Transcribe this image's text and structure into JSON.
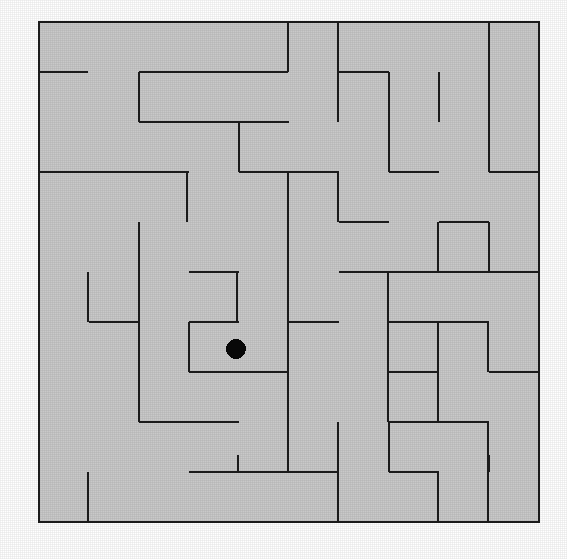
{
  "figure": {
    "kind": "maze-puzzle",
    "background_color": "#ffffff",
    "interior_color": "#c9c9c9",
    "wall_color": "#1c1c1c",
    "marker_color": "#080808",
    "canvas": {
      "width": 567,
      "height": 559
    }
  },
  "maze": {
    "origin_x": 39,
    "origin_y": 22,
    "cell_size": 50,
    "cols": 10,
    "rows": 10,
    "wall_thickness": 2.4,
    "border": {
      "x": 39,
      "y": 22,
      "width": 500,
      "height": 500
    },
    "marker": {
      "cx": 236,
      "cy": 349,
      "r": 10,
      "shape": "filled-circle",
      "label": "position-dot"
    },
    "horizontal_walls": [
      [
        39,
        72,
        88
      ],
      [
        139,
        72,
        288
      ],
      [
        339,
        72,
        389
      ],
      [
        139,
        122,
        289
      ],
      [
        39,
        172,
        189
      ],
      [
        239,
        172,
        289
      ],
      [
        289,
        172,
        339
      ],
      [
        389,
        172,
        439
      ],
      [
        489,
        172,
        539
      ],
      [
        339,
        222,
        389
      ],
      [
        439,
        222,
        489
      ],
      [
        189,
        272,
        239
      ],
      [
        339,
        272,
        389
      ],
      [
        389,
        272,
        489
      ],
      [
        489,
        272,
        539
      ],
      [
        89,
        322,
        139
      ],
      [
        189,
        322,
        239
      ],
      [
        289,
        322,
        339
      ],
      [
        389,
        322,
        439
      ],
      [
        439,
        322,
        489
      ],
      [
        189,
        372,
        289
      ],
      [
        389,
        372,
        439
      ],
      [
        489,
        372,
        539
      ],
      [
        139,
        422,
        189
      ],
      [
        189,
        422,
        239
      ],
      [
        389,
        422,
        439
      ],
      [
        439,
        422,
        489
      ],
      [
        189,
        472,
        289
      ],
      [
        289,
        472,
        339
      ],
      [
        389,
        472,
        439
      ]
    ],
    "vertical_walls": [
      [
        139,
        72,
        122
      ],
      [
        239,
        122,
        172
      ],
      [
        288,
        22,
        72
      ],
      [
        338,
        22,
        122
      ],
      [
        389,
        72,
        172
      ],
      [
        439,
        72,
        122
      ],
      [
        489,
        22,
        172
      ],
      [
        288,
        172,
        272
      ],
      [
        338,
        172,
        222
      ],
      [
        438,
        222,
        272
      ],
      [
        139,
        222,
        272
      ],
      [
        187,
        172,
        222
      ],
      [
        88,
        272,
        322
      ],
      [
        139,
        272,
        422
      ],
      [
        237,
        272,
        322
      ],
      [
        288,
        272,
        372
      ],
      [
        388,
        272,
        322
      ],
      [
        489,
        222,
        272
      ],
      [
        189,
        322,
        372
      ],
      [
        288,
        372,
        472
      ],
      [
        388,
        322,
        422
      ],
      [
        438,
        322,
        422
      ],
      [
        488,
        322,
        372
      ],
      [
        338,
        422,
        522
      ],
      [
        238,
        455,
        472
      ],
      [
        389,
        422,
        472
      ],
      [
        488,
        422,
        522
      ],
      [
        88,
        472,
        522
      ],
      [
        489,
        455,
        472
      ],
      [
        438,
        472,
        522
      ]
    ]
  }
}
